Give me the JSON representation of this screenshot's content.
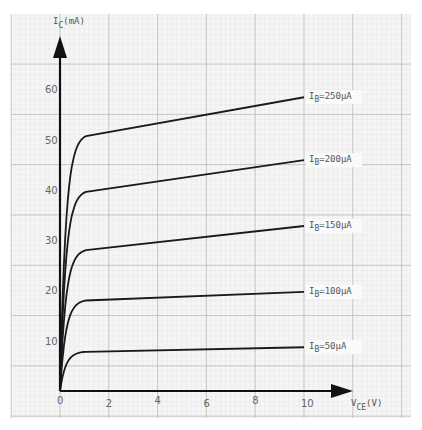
{
  "chart_data": {
    "type": "line",
    "title": "",
    "xlabel": "V_CE (V)",
    "ylabel": "I_C (mA)",
    "xlim": [
      0,
      12
    ],
    "ylim": [
      0,
      70
    ],
    "x_ticks": [
      0,
      2,
      4,
      6,
      8,
      10
    ],
    "y_ticks": [
      10,
      20,
      30,
      40,
      50,
      60
    ],
    "grid": true,
    "legend": "inline labels at right end of each curve",
    "series": [
      {
        "name": "I_B=50µA",
        "x": [
          0,
          0.25,
          0.5,
          1.0,
          10
        ],
        "values": [
          0,
          4.0,
          6.2,
          7.8,
          8.7
        ]
      },
      {
        "name": "I_B=100µA",
        "x": [
          0,
          0.25,
          0.5,
          1.0,
          10
        ],
        "values": [
          0,
          11.0,
          15.5,
          18.0,
          19.7
        ]
      },
      {
        "name": "I_B=150µA",
        "x": [
          0,
          0.25,
          0.5,
          1.0,
          10
        ],
        "values": [
          0,
          19.5,
          25.0,
          28.0,
          32.8
        ]
      },
      {
        "name": "I_B=200µA",
        "x": [
          0,
          0.25,
          0.5,
          1.0,
          10
        ],
        "values": [
          0,
          30.0,
          36.5,
          39.6,
          45.9
        ]
      },
      {
        "name": "I_B=250µA",
        "x": [
          0,
          0.25,
          0.5,
          1.0,
          10
        ],
        "values": [
          0,
          42.0,
          48.0,
          50.7,
          58.4
        ]
      }
    ]
  },
  "axes": {
    "y_label_main": "I",
    "y_label_sub": "C",
    "y_label_unit": "(mA)",
    "x_label_main": "V",
    "x_label_sub": "CE",
    "x_label_unit": "(V)"
  },
  "curve_labels": [
    {
      "main": "I",
      "sub": "B",
      "value": "=50µA"
    },
    {
      "main": "I",
      "sub": "B",
      "value": "=100µA"
    },
    {
      "main": "I",
      "sub": "B",
      "value": "=150µA"
    },
    {
      "main": "I",
      "sub": "B",
      "value": "=200µA"
    },
    {
      "main": "I",
      "sub": "B",
      "value": "=250µA"
    }
  ],
  "colors": {
    "paper": "#f4f4f4",
    "grid_minor": "#dcdcdc",
    "grid_major": "#b8b8b8",
    "curve": "#1a1a1a",
    "axis": "#111111",
    "text": "#555555"
  }
}
